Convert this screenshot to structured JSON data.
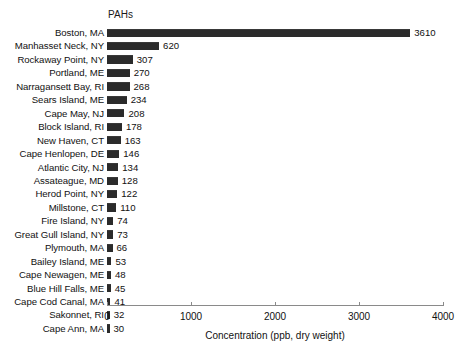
{
  "chart_data": {
    "type": "bar",
    "orientation": "horizontal",
    "title": "PAHs",
    "xlabel": "Concentration (ppb, dry weight)",
    "ylabel": "",
    "xlim": [
      0,
      4000
    ],
    "xticks": [
      0,
      1000,
      2000,
      3000,
      4000
    ],
    "grid": false,
    "legend": null,
    "bar_color": "#2b2b2b",
    "axis_color": "#8a8a8a",
    "categories": [
      "Boston, MA",
      "Manhasset Neck, NY",
      "Rockaway Point, NY",
      "Portland, ME",
      "Narragansett Bay, RI",
      "Sears Island, ME",
      "Cape May, NJ",
      "Block Island, RI",
      "New Haven, CT",
      "Cape Henlopen, DE",
      "Atlantic City, NJ",
      "Assateague, MD",
      "Herod Point, NY",
      "Millstone, CT",
      "Fire Island, NY",
      "Great Gull Island, NY",
      "Plymouth, MA",
      "Bailey Island, ME",
      "Cape Newagen, ME",
      "Blue Hill Falls, ME",
      "Cape Cod Canal, MA",
      "Sakonnet, RI",
      "Cape Ann, MA"
    ],
    "values": [
      3610,
      620,
      307,
      270,
      268,
      234,
      208,
      178,
      163,
      146,
      134,
      128,
      122,
      110,
      74,
      73,
      66,
      53,
      48,
      45,
      41,
      32,
      30
    ],
    "value_labels": [
      "3610",
      "620",
      "307",
      "270",
      "268",
      "234",
      "208",
      "178",
      "163",
      "146",
      "134",
      "128",
      "122",
      "110",
      "74",
      "73",
      "66",
      "53",
      "48",
      "45",
      "41",
      "32",
      "30"
    ],
    "xtick_labels": [
      "0",
      "1000",
      "2000",
      "3000",
      "4000"
    ]
  }
}
